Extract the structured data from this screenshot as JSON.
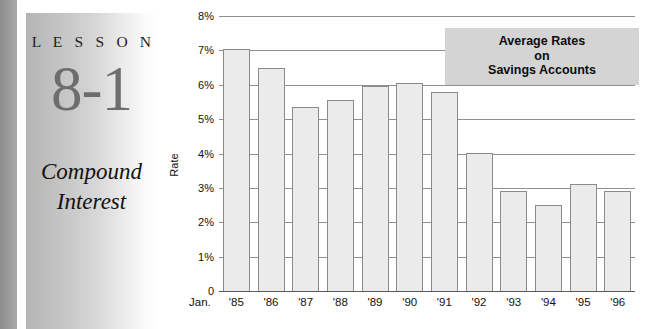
{
  "lesson": {
    "word": "L E S S O N",
    "number": "8-1",
    "title_line1": "Compound",
    "title_line2": "Interest"
  },
  "legend": {
    "line1": "Average Rates",
    "line2": "on",
    "line3": "Savings Accounts"
  },
  "axis": {
    "jan_label": "Jan.",
    "y_title": "Rate"
  },
  "colors": {
    "bar_fill": "#ebebeb",
    "bar_border": "#8a8a8a",
    "gridline": "#909090",
    "legend_bg": "#d4d4d4",
    "lesson_number": "#6e6e6e"
  },
  "chart_data": {
    "type": "bar",
    "title": "Average Rates on Savings Accounts",
    "xlabel": "Jan.",
    "ylabel": "Rate",
    "ylim": [
      0,
      8
    ],
    "grid": true,
    "legend_position": "inside-top-right",
    "ytick_labels": [
      "0",
      "1%",
      "2%",
      "3%",
      "4%",
      "5%",
      "6%",
      "7%",
      "8%"
    ],
    "ytick_values": [
      0,
      1,
      2,
      3,
      4,
      5,
      6,
      7,
      8
    ],
    "categories": [
      "'85",
      "'86",
      "'87",
      "'88",
      "'89",
      "'90",
      "'91",
      "'92",
      "'93",
      "'94",
      "'95",
      "'96"
    ],
    "values": [
      7.05,
      6.5,
      5.35,
      5.55,
      5.95,
      6.05,
      5.8,
      4.0,
      2.9,
      2.5,
      3.1,
      2.9
    ]
  }
}
